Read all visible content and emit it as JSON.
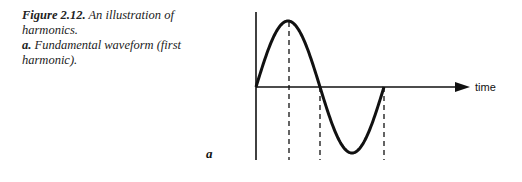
{
  "caption": {
    "figure_label": "Figure 2.12.",
    "figure_title": "An illustration of harmonics.",
    "sub_label": "a.",
    "sub_text": "Fundamental waveform (first harmonic)."
  },
  "panel": {
    "label": "a"
  },
  "chart_data": {
    "type": "line",
    "title": "Fundamental waveform (first harmonic)",
    "xlabel": "time",
    "ylabel": "",
    "series": [
      {
        "name": "fundamental",
        "function": "sine",
        "cycles": 1,
        "x": [
          0,
          0.25,
          0.5,
          0.75,
          1.0
        ],
        "values": [
          0,
          1,
          0,
          -1,
          0
        ]
      }
    ],
    "guides": {
      "dashed_verticals_at": [
        0.25,
        0.5,
        1.0
      ]
    },
    "grid": false,
    "legend": false
  }
}
